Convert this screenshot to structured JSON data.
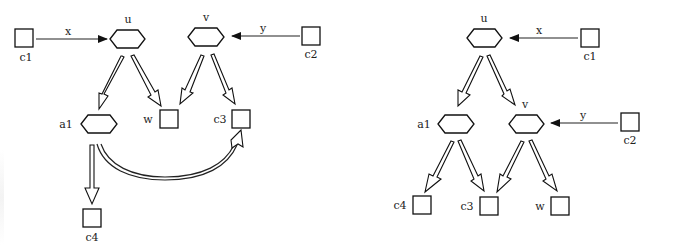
{
  "diagrams": [
    {
      "name": "left-diagram",
      "nodes": {
        "c1": {
          "label": "c1",
          "type": "square"
        },
        "u": {
          "label": "u",
          "type": "hexagon"
        },
        "v": {
          "label": "v",
          "type": "hexagon"
        },
        "c2": {
          "label": "c2",
          "type": "square"
        },
        "a1": {
          "label": "a1",
          "type": "hexagon"
        },
        "w": {
          "label": "w",
          "type": "square"
        },
        "c3": {
          "label": "c3",
          "type": "square"
        },
        "c4": {
          "label": "c4",
          "type": "square"
        }
      },
      "edges": {
        "x": {
          "label": "x",
          "from": "c1",
          "to": "u",
          "style": "single-arrow"
        },
        "y": {
          "label": "y",
          "from": "c2",
          "to": "v",
          "style": "single-arrow"
        },
        "u_a1": {
          "from": "u",
          "to": "a1",
          "style": "double-arrow"
        },
        "u_w": {
          "from": "u",
          "to": "w",
          "style": "double-arrow"
        },
        "v_w": {
          "from": "v",
          "to": "w",
          "style": "double-arrow"
        },
        "v_c3": {
          "from": "v",
          "to": "c3",
          "style": "double-arrow"
        },
        "a1_c4": {
          "from": "a1",
          "to": "c4",
          "style": "double-arrow"
        },
        "a1_c3": {
          "from": "a1",
          "to": "c3",
          "style": "double-arrow-curved"
        }
      }
    },
    {
      "name": "right-diagram",
      "nodes": {
        "u": {
          "label": "u",
          "type": "hexagon"
        },
        "c1": {
          "label": "c1",
          "type": "square"
        },
        "a1": {
          "label": "a1",
          "type": "hexagon"
        },
        "v": {
          "label": "v",
          "type": "hexagon"
        },
        "c2": {
          "label": "c2",
          "type": "square"
        },
        "c4": {
          "label": "c4",
          "type": "square"
        },
        "c3": {
          "label": "c3",
          "type": "square"
        },
        "w": {
          "label": "w",
          "type": "square"
        }
      },
      "edges": {
        "x": {
          "label": "x",
          "from": "c1",
          "to": "u",
          "style": "single-arrow"
        },
        "y": {
          "label": "y",
          "from": "c2",
          "to": "v",
          "style": "single-arrow"
        },
        "u_a1": {
          "from": "u",
          "to": "a1",
          "style": "double-arrow"
        },
        "u_v": {
          "from": "u",
          "to": "v",
          "style": "double-arrow"
        },
        "a1_c4": {
          "from": "a1",
          "to": "c4",
          "style": "double-arrow"
        },
        "a1_c3": {
          "from": "a1",
          "to": "c3",
          "style": "double-arrow"
        },
        "v_c3": {
          "from": "v",
          "to": "c3",
          "style": "double-arrow"
        },
        "v_w": {
          "from": "v",
          "to": "w",
          "style": "double-arrow"
        }
      }
    }
  ],
  "colors": {
    "stroke": "#111111",
    "background": "#ffffff"
  }
}
